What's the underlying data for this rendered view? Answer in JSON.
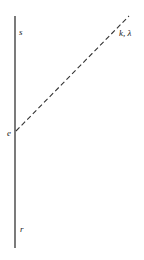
{
  "diagram": {
    "labels": {
      "s": "s",
      "k_lambda": "k, λ",
      "e": "e",
      "r": "r"
    },
    "vertical_line": {
      "x": 15,
      "y1": 16,
      "y2": 248,
      "color": "#222222"
    },
    "dashed_line": {
      "x1": 15,
      "y1": 132,
      "x2": 129,
      "y2": 16,
      "color": "#333333"
    }
  }
}
